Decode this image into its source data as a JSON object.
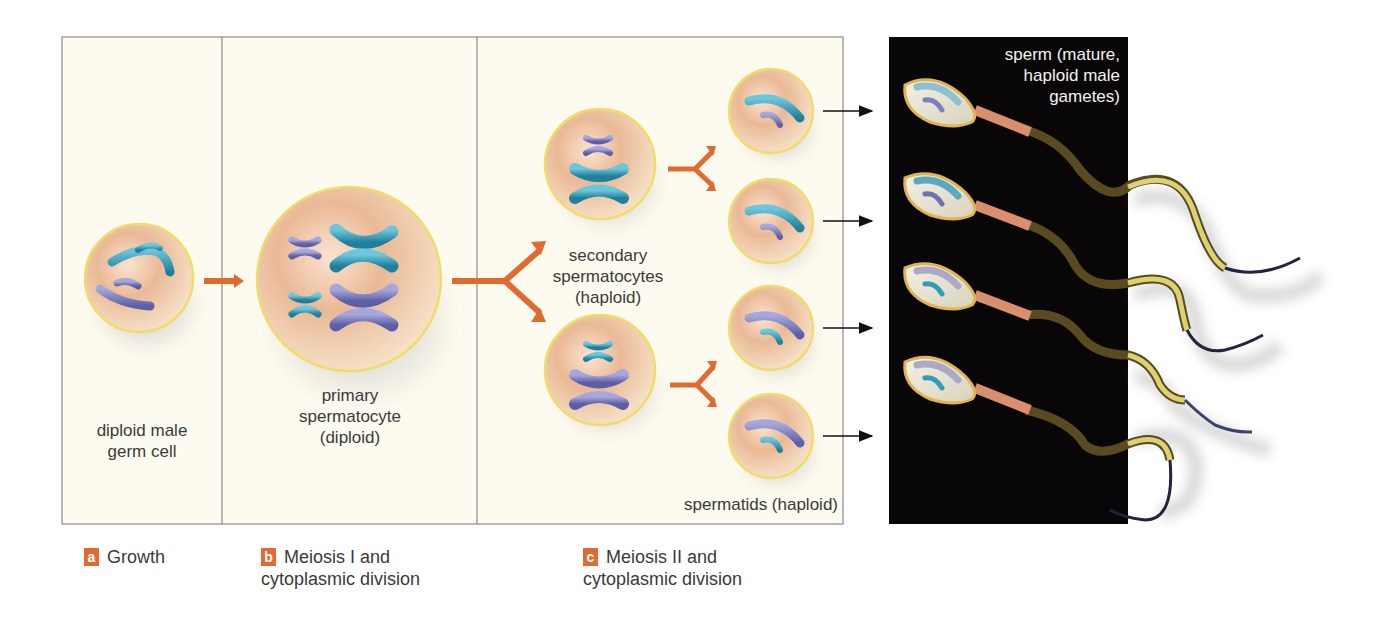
{
  "figure": {
    "colors": {
      "panel_bg": "#fdfbef",
      "panel_border": "#8a8a8a",
      "dark_panel_bg": "#080606",
      "arrow_orange": "#e06a30",
      "badge_orange": "#e06a30",
      "cell_fill": "#e9b894",
      "cell_rim": "#f1dc6a",
      "chromosome_teal": "#2f9cb8",
      "chromosome_purple": "#7d7fc0",
      "tail_yellow": "#d9cf66",
      "tail_dark": "#1f2440"
    },
    "stages": [
      {
        "id": "a",
        "badge": "a",
        "title": "Growth",
        "cell_label": "diploid male germ cell"
      },
      {
        "id": "b",
        "badge": "b",
        "title": "Meiosis I and cytoplasmic division",
        "cell_label": "primary spermatocyte (diploid)"
      },
      {
        "id": "c",
        "badge": "c",
        "title": "Meiosis II and cytoplasmic division",
        "cell_label": "secondary spermatocytes (haploid)"
      }
    ],
    "labels": {
      "germ_cell_line1": "diploid male",
      "germ_cell_line2": "germ cell",
      "primary_line1": "primary",
      "primary_line2": "spermatocyte",
      "primary_line3": "(diploid)",
      "secondary_line1": "secondary",
      "secondary_line2": "spermatocytes",
      "secondary_line3": "(haploid)",
      "spermatids": "spermatids (haploid)",
      "sperm_line1": "sperm (mature,",
      "sperm_line2": "haploid male",
      "sperm_line3": "gametes)"
    },
    "captions": {
      "a_badge": "a",
      "a_line1": "Growth",
      "b_badge": "b",
      "b_line1": "Meiosis I and",
      "b_line2": "cytoplasmic division",
      "c_badge": "c",
      "c_line1": "Meiosis II and",
      "c_line2": "cytoplasmic division"
    },
    "counts": {
      "secondary_spermatocytes": 2,
      "spermatids": 4,
      "sperm": 4
    }
  }
}
